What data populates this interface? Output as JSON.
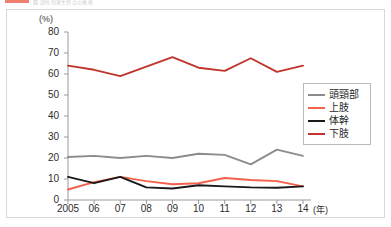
{
  "header": {
    "swatch_color": "#ef6a55",
    "caption": "図 部位別発生割合の推移"
  },
  "axes": {
    "y_unit": "(%)",
    "y_ticks": [
      "80",
      "70",
      "60",
      "50",
      "40",
      "30",
      "20",
      "10",
      "0"
    ],
    "x_ticks": [
      "2005",
      "06",
      "07",
      "08",
      "09",
      "10",
      "11",
      "12",
      "13",
      "14"
    ],
    "x_unit": "(年)"
  },
  "legend": {
    "items": [
      {
        "label": "頭頸部",
        "color": "#8c8c8c"
      },
      {
        "label": "上肢",
        "color": "#f4614b"
      },
      {
        "label": "体幹",
        "color": "#1a1a1a"
      },
      {
        "label": "下肢",
        "color": "#c0352c"
      }
    ]
  },
  "chart_data": {
    "type": "line",
    "title": "",
    "xlabel": "(年)",
    "ylabel": "(%)",
    "ylim": [
      0,
      80
    ],
    "ytick_step": 10,
    "grid": false,
    "legend_position": "right",
    "categories": [
      "2005",
      "06",
      "07",
      "08",
      "09",
      "10",
      "11",
      "12",
      "13",
      "14"
    ],
    "series": [
      {
        "name": "下肢",
        "color": "#c0352c",
        "values": [
          64,
          62,
          59,
          63.5,
          68,
          63,
          61.5,
          67.5,
          61,
          64
        ]
      },
      {
        "name": "頭頸部",
        "color": "#8c8c8c",
        "values": [
          20.5,
          21,
          20,
          21,
          20,
          22,
          21.5,
          17,
          24,
          21
        ]
      },
      {
        "name": "上肢",
        "color": "#f4614b",
        "values": [
          5,
          8.5,
          11,
          9,
          7.5,
          8,
          10.5,
          9.5,
          9,
          6.5
        ]
      },
      {
        "name": "体幹",
        "color": "#1a1a1a",
        "values": [
          11,
          8,
          11,
          6,
          5.5,
          7,
          6.5,
          6,
          5.8,
          6.5
        ]
      }
    ]
  }
}
